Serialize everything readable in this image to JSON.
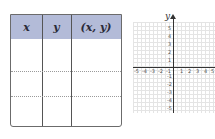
{
  "table": {
    "headers": [
      "x",
      "y",
      "(x, y)"
    ],
    "rows": [
      [
        "",
        "",
        ""
      ],
      [
        "",
        "",
        ""
      ],
      [
        "",
        "",
        ""
      ]
    ],
    "header_color": "#b3bbd8"
  },
  "graph": {
    "y_axis_label": "y",
    "x_ticks": [
      "-5",
      "-4",
      "-3",
      "-2",
      "-1",
      "1",
      "2",
      "3",
      "4",
      "5"
    ],
    "y_ticks": [
      "5",
      "4",
      "3",
      "2",
      "1",
      "-1",
      "-2",
      "-3",
      "-4",
      "-5"
    ],
    "range": {
      "x": [
        -5,
        5
      ],
      "y": [
        -5,
        5
      ]
    }
  }
}
